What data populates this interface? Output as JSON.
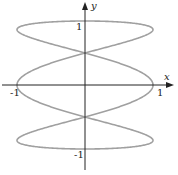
{
  "chart_data": {
    "type": "line",
    "title": "",
    "xlabel": "x",
    "ylabel": "y",
    "xlim": [
      -1.25,
      1.25
    ],
    "ylim": [
      -1.25,
      1.25
    ],
    "grid": false,
    "x_ticks": [
      {
        "value": -1,
        "label": "-1"
      },
      {
        "value": 1,
        "label": "1"
      }
    ],
    "y_ticks": [
      {
        "value": 1,
        "label": "1"
      },
      {
        "value": -1,
        "label": "-1"
      }
    ],
    "series": [
      {
        "name": "curve",
        "parametric": {
          "x": "cos(3t)",
          "y": "sin(t)",
          "t_range": [
            0,
            6.2832
          ]
        },
        "key_points": [
          {
            "x": 1,
            "y": 0
          },
          {
            "x": -1,
            "y": 0
          },
          {
            "x": 0,
            "y": 1
          },
          {
            "x": 0,
            "y": -1
          },
          {
            "x": 0,
            "y": 0.5
          },
          {
            "x": 0,
            "y": -0.5
          },
          {
            "x": -1,
            "y": 0.866
          },
          {
            "x": 1,
            "y": 0.866
          },
          {
            "x": -1,
            "y": -0.866
          },
          {
            "x": 1,
            "y": -0.866
          }
        ],
        "color": "#a0a0a0"
      }
    ]
  },
  "axes": {
    "x_label": "x",
    "y_label": "y",
    "x_neg": "-1",
    "x_pos": "1",
    "y_pos": "1",
    "y_neg": "-1"
  }
}
